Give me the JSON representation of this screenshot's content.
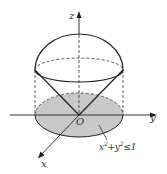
{
  "diagram": {
    "type": "3d-solid",
    "axes": {
      "x_label": "x",
      "y_label": "y",
      "z_label": "z",
      "origin_label": "O"
    },
    "region": {
      "label_base": "x",
      "label_exp1": "2",
      "label_plus": "+y",
      "label_exp2": "2",
      "label_ineq": "≤1",
      "fill_color": "#c8c8c8"
    },
    "colors": {
      "stroke": "#222222",
      "dashed": "#333333"
    }
  }
}
